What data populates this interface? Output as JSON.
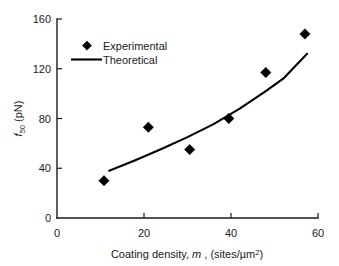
{
  "chart_data": {
    "type": "scatter",
    "title": "",
    "xlabel": "Coating density, m , (sites/µm²)",
    "ylabel": "f₅₀ (pN)",
    "xlabel_parts": {
      "prefix": "Coating density, ",
      "variable": "m",
      "middle": " , (sites/µm",
      "exponent": "2",
      "suffix": ")"
    },
    "ylabel_parts": {
      "variable": "f",
      "subscript": "50",
      "units": " (pN)"
    },
    "xlim": [
      0,
      60
    ],
    "ylim": [
      0,
      160
    ],
    "xticks": [
      0,
      20,
      40,
      60
    ],
    "yticks": [
      0,
      40,
      80,
      120,
      160
    ],
    "xtick_labels": [
      "0",
      "20",
      "40",
      "60"
    ],
    "ytick_labels": [
      "0",
      "40",
      "80",
      "120",
      "160"
    ],
    "grid": false,
    "legend_position": "upper-left-inside",
    "series": [
      {
        "name": "Experimental",
        "type": "scatter",
        "marker": "diamond",
        "color": "#000000",
        "x": [
          10.8,
          21.0,
          30.5,
          39.5,
          48.0,
          57.0
        ],
        "y": [
          30.0,
          73.0,
          55.0,
          80.0,
          117.0,
          148.0
        ]
      },
      {
        "name": "Theoretical",
        "type": "line",
        "color": "#000000",
        "x": [
          12.0,
          18.0,
          24.0,
          30.0,
          36.0,
          42.0,
          48.0,
          52.0,
          57.5
        ],
        "y": [
          38.0,
          46.5,
          55.5,
          65.0,
          75.5,
          88.0,
          102.0,
          112.0,
          132.0
        ]
      }
    ],
    "legend": [
      {
        "label": "Experimental",
        "symbol": "diamond"
      },
      {
        "label": "Theoretical",
        "symbol": "line"
      }
    ]
  }
}
